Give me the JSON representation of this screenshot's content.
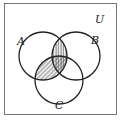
{
  "diagram": {
    "type": "venn",
    "universe_label": "U",
    "sets": [
      {
        "label": "A",
        "cx": 43,
        "cy": 56,
        "r": 24
      },
      {
        "label": "B",
        "cx": 76,
        "cy": 56,
        "r": 24
      },
      {
        "label": "C",
        "cx": 59,
        "cy": 80,
        "r": 24
      }
    ],
    "shaded_regions": [
      "A∩B",
      "A∩C"
    ],
    "colors": {
      "stroke": "#222222",
      "background": "#ffffff"
    }
  }
}
